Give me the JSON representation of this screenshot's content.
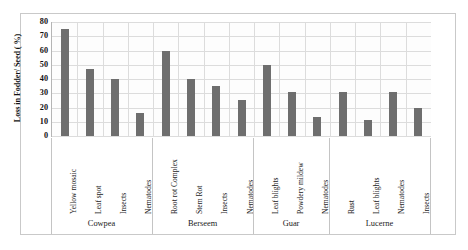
{
  "chart_data": {
    "type": "bar",
    "title": "",
    "xlabel": "",
    "ylabel": "Loss in Fodder/ Seed ( %)",
    "ylim": [
      0,
      80
    ],
    "ytick_step": 10,
    "yticks": [
      "0",
      "10",
      "20",
      "30",
      "40",
      "50",
      "60",
      "70",
      "80"
    ],
    "grid": true,
    "legend": "none",
    "bar_color": "#6e6e6e",
    "gridline_color": "#dcdcdc",
    "axis_color": "#b5b5b5",
    "categories": [
      "Yellow mosaic",
      "Leaf spot",
      "Insects",
      "Nematodes",
      "Root rot Complex",
      "Stem Rot",
      "Insects",
      "Nematodes",
      "Leaf blights",
      "Powdery mildew",
      "Nematodes",
      "Rust",
      "Leaf blights",
      "Nematodes",
      "Insects"
    ],
    "values": [
      75,
      47,
      40,
      16,
      60,
      40,
      35,
      25,
      50,
      31,
      13,
      31,
      11,
      31,
      20
    ],
    "groups": [
      {
        "name": "Cowpea",
        "count": 4
      },
      {
        "name": "Berseem",
        "count": 4
      },
      {
        "name": "Guar",
        "count": 3
      },
      {
        "name": "Lucerne",
        "count": 4
      }
    ]
  }
}
